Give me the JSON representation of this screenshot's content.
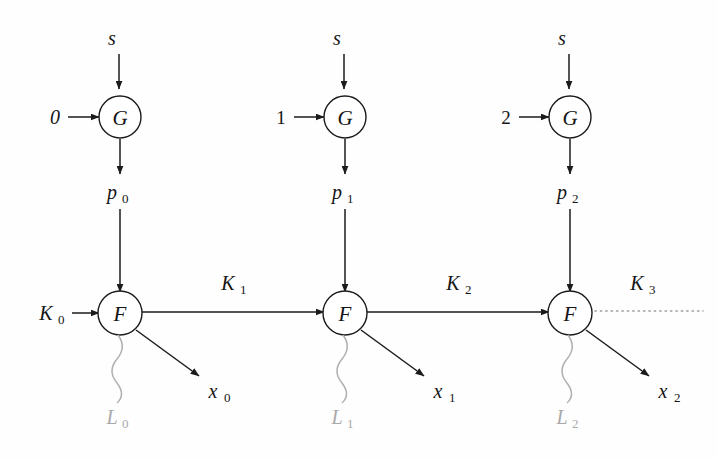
{
  "figure": {
    "background_color": "#fefefe",
    "ink_color": "#1b1b1b",
    "faded_color": "#a9a9a9",
    "dotted_color": "#9a9a9a"
  },
  "stages": [
    {
      "index_input": "0",
      "seed_input": "s",
      "gen_node": "G",
      "intermediate": "p",
      "intermediate_sub": "0",
      "proc_node": "F",
      "key_in": "K",
      "key_in_sub": "0",
      "key_out": "K",
      "key_out_sub": "1",
      "output": "x",
      "output_sub": "0",
      "leak": "L",
      "leak_sub": "0"
    },
    {
      "index_input": "1",
      "seed_input": "s",
      "gen_node": "G",
      "intermediate": "p",
      "intermediate_sub": "1",
      "proc_node": "F",
      "key_in": "K",
      "key_in_sub": "1",
      "key_out": "K",
      "key_out_sub": "2",
      "output": "x",
      "output_sub": "1",
      "leak": "L",
      "leak_sub": "1"
    },
    {
      "index_input": "2",
      "seed_input": "s",
      "gen_node": "G",
      "intermediate": "p",
      "intermediate_sub": "2",
      "proc_node": "F",
      "key_in": "K",
      "key_in_sub": "2",
      "key_out": "K",
      "key_out_sub": "3",
      "output": "x",
      "output_sub": "2",
      "leak": "L",
      "leak_sub": "2"
    }
  ],
  "continuation": {
    "label": "K",
    "label_sub": "3",
    "style": "dotted"
  }
}
